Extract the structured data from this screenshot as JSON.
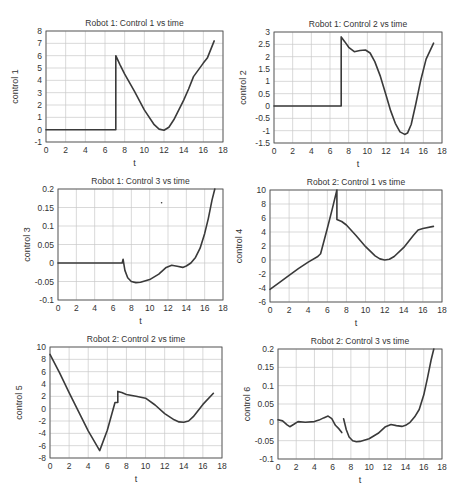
{
  "figure": {
    "width": 464,
    "height": 495
  },
  "chart_data": [
    {
      "id": "c1",
      "type": "line",
      "title": "Robot 1: Control 1 vs time",
      "xlabel": "t",
      "ylabel": "control 1",
      "xlim": [
        0,
        18
      ],
      "ylim": [
        -1,
        8
      ],
      "xticks": [
        0,
        2,
        4,
        6,
        8,
        10,
        12,
        14,
        16,
        18
      ],
      "yticks": [
        -1,
        0,
        1,
        2,
        3,
        4,
        5,
        6,
        7,
        8
      ],
      "grid": true,
      "box": {
        "x0": 46,
        "y0": 31,
        "x1": 223,
        "y1": 142
      },
      "series": [
        {
          "name": "control 1",
          "x": [
            0,
            7.1,
            7.1,
            7.5,
            8,
            9,
            10,
            11,
            11.5,
            12,
            12.5,
            13,
            14,
            14.5,
            15,
            16,
            16.4,
            17.1
          ],
          "y": [
            0,
            0,
            6.0,
            5.3,
            4.5,
            3.1,
            1.6,
            0.4,
            0.05,
            -0.05,
            0.2,
            0.8,
            2.4,
            3.3,
            4.3,
            5.4,
            5.8,
            7.2
          ]
        }
      ]
    },
    {
      "id": "c2",
      "type": "line",
      "title": "Robot 1: Control 2 vs time",
      "xlabel": "t",
      "ylabel": "control 2",
      "xlim": [
        0,
        18
      ],
      "ylim": [
        -1.5,
        3
      ],
      "xticks": [
        0,
        2,
        4,
        6,
        8,
        10,
        12,
        14,
        16,
        18
      ],
      "yticks": [
        -1.5,
        -1,
        -0.5,
        0,
        0.5,
        1,
        1.5,
        2,
        2.5,
        3
      ],
      "grid": true,
      "box": {
        "x0": 274,
        "y0": 32,
        "x1": 442,
        "y1": 143
      },
      "series": [
        {
          "name": "control 2",
          "x": [
            0,
            7.2,
            7.2,
            7.6,
            8,
            8.6,
            9.2,
            9.8,
            10.3,
            10.8,
            11.4,
            12,
            12.5,
            13,
            13.5,
            14,
            14.3,
            14.7,
            15.2,
            15.7,
            16.3,
            17.1
          ],
          "y": [
            0,
            0,
            2.8,
            2.6,
            2.38,
            2.2,
            2.25,
            2.27,
            2.15,
            1.8,
            1.2,
            0.45,
            -0.2,
            -0.7,
            -1.05,
            -1.15,
            -1.1,
            -0.75,
            0.1,
            1.0,
            1.9,
            2.55
          ]
        }
      ]
    },
    {
      "id": "c3",
      "type": "line",
      "title": "Robot 1: Control 3 vs time",
      "xlabel": "t",
      "ylabel": "control 3",
      "xlim": [
        0,
        18
      ],
      "ylim": [
        -0.1,
        0.2
      ],
      "xticks": [
        0,
        2,
        4,
        6,
        8,
        10,
        12,
        14,
        16,
        18
      ],
      "yticks": [
        -0.1,
        -0.05,
        0,
        0.05,
        0.1,
        0.15,
        0.2
      ],
      "grid": true,
      "box": {
        "x0": 58,
        "y0": 189,
        "x1": 223,
        "y1": 300
      },
      "series": [
        {
          "name": "control 3",
          "x": [
            0,
            7.0,
            7.1,
            7.3,
            7.6,
            8.0,
            8.5,
            9.0,
            10.0,
            11.0,
            11.8,
            12.4,
            13.0,
            13.6,
            14.0,
            14.5,
            15.0,
            15.5,
            16.0,
            16.4,
            16.8,
            17.1
          ],
          "y": [
            0,
            0,
            0.01,
            -0.02,
            -0.04,
            -0.05,
            -0.053,
            -0.052,
            -0.045,
            -0.03,
            -0.012,
            -0.006,
            -0.009,
            -0.012,
            -0.008,
            0.0,
            0.015,
            0.04,
            0.08,
            0.12,
            0.17,
            0.2
          ]
        }
      ],
      "annotations": [
        {
          "type": "stray-dot",
          "x": 11.3,
          "y": 0.163
        }
      ]
    },
    {
      "id": "c4",
      "type": "line",
      "title": "Robot 2: Control 1 vs time",
      "xlabel": "t",
      "ylabel": "control 4",
      "xlim": [
        0,
        18
      ],
      "ylim": [
        -6,
        10
      ],
      "xticks": [
        0,
        2,
        4,
        6,
        8,
        10,
        12,
        14,
        16,
        18
      ],
      "yticks": [
        -6,
        -4,
        -2,
        0,
        2,
        4,
        6,
        8,
        10
      ],
      "grid": true,
      "box": {
        "x0": 270,
        "y0": 190,
        "x1": 442,
        "y1": 302
      },
      "series": [
        {
          "name": "control 4",
          "x": [
            0,
            1,
            2,
            3,
            4,
            5,
            5.3,
            6,
            6.5,
            7.0,
            7.0,
            7.5,
            8,
            9,
            10,
            11,
            11.5,
            12,
            12.5,
            13,
            14,
            15,
            15.5,
            16,
            17.1
          ],
          "y": [
            -4.2,
            -3.2,
            -2.2,
            -1.2,
            -0.3,
            0.5,
            0.9,
            4.5,
            7.2,
            10,
            5.8,
            5.5,
            5.0,
            3.5,
            1.9,
            0.6,
            0.15,
            0.0,
            0.1,
            0.5,
            1.8,
            3.5,
            4.3,
            4.5,
            4.8
          ]
        }
      ]
    },
    {
      "id": "c5",
      "type": "line",
      "title": "Robot 2: Control 2 vs time",
      "xlabel": "t",
      "ylabel": "control 5",
      "xlim": [
        0,
        18
      ],
      "ylim": [
        -8,
        10
      ],
      "xticks": [
        0,
        2,
        4,
        6,
        8,
        10,
        12,
        14,
        16,
        18
      ],
      "yticks": [
        -8,
        -6,
        -4,
        -2,
        0,
        2,
        4,
        6,
        8,
        10
      ],
      "grid": true,
      "box": {
        "x0": 50,
        "y0": 347,
        "x1": 222,
        "y1": 458
      },
      "series": [
        {
          "name": "control 5",
          "x": [
            0,
            1,
            2,
            3,
            4,
            5.2,
            6,
            6.8,
            6.8,
            7.1,
            7.1,
            7.5,
            8,
            9,
            10,
            11,
            12,
            13,
            13.5,
            14,
            14.5,
            15,
            16,
            17.1
          ],
          "y": [
            8.8,
            5.8,
            2.6,
            -0.5,
            -3.6,
            -6.8,
            -3.5,
            1.0,
            1.0,
            1.0,
            2.8,
            2.6,
            2.3,
            2.0,
            1.7,
            0.6,
            -0.8,
            -1.8,
            -2.15,
            -2.2,
            -2.0,
            -1.3,
            0.7,
            2.5
          ]
        }
      ]
    },
    {
      "id": "c6",
      "type": "line",
      "title": "Robot 2: Control 3 vs time",
      "xlabel": "t",
      "ylabel": "control 6",
      "xlim": [
        0,
        18
      ],
      "ylim": [
        -0.1,
        0.2
      ],
      "xticks": [
        0,
        2,
        4,
        6,
        8,
        10,
        12,
        14,
        16,
        18
      ],
      "yticks": [
        -0.1,
        -0.05,
        0,
        0.05,
        0.1,
        0.15,
        0.2
      ],
      "grid": true,
      "box": {
        "x0": 278,
        "y0": 349,
        "x1": 442,
        "y1": 459
      },
      "series": [
        {
          "name": "control 6 (part 1)",
          "x": [
            0,
            0.5,
            1.0,
            1.3,
            1.7,
            2.2,
            3.0,
            4.0,
            4.5,
            5.0,
            5.5,
            5.9,
            6.3,
            6.7,
            7.0
          ],
          "y": [
            0.007,
            0.004,
            -0.007,
            -0.012,
            -0.006,
            0.002,
            0.0,
            0.002,
            0.006,
            0.012,
            0.017,
            0.01,
            -0.008,
            -0.018,
            -0.028
          ]
        },
        {
          "name": "control 6 (part 2)",
          "x": [
            7.2,
            7.5,
            7.8,
            8.2,
            8.6,
            9.0,
            10,
            11,
            11.8,
            12.4,
            13.0,
            13.6,
            14.0,
            14.5,
            15.0,
            15.5,
            16.0,
            16.4,
            16.8,
            17.1
          ],
          "y": [
            0.01,
            -0.02,
            -0.04,
            -0.05,
            -0.053,
            -0.052,
            -0.045,
            -0.03,
            -0.012,
            -0.006,
            -0.009,
            -0.011,
            -0.008,
            0.0,
            0.015,
            0.035,
            0.075,
            0.12,
            0.17,
            0.2
          ]
        }
      ]
    }
  ],
  "style": {
    "line_color": "#3a3a3a",
    "grid_color": "#c8c8c8",
    "axis_color": "#555555",
    "text_color": "#333333"
  }
}
